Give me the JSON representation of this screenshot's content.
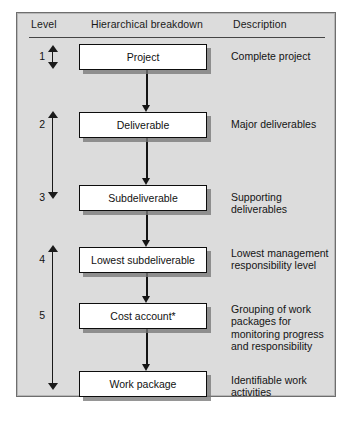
{
  "figure": {
    "background_color": "#ffffff",
    "panel_color": "#dcdcdc",
    "line_color": "#141414"
  },
  "columns": {
    "level_header": "Level",
    "breakdown_header": "Hierarchical breakdown",
    "description_header": "Description"
  },
  "rows": [
    {
      "level": "1",
      "box_label": "Project",
      "description": "Complete project"
    },
    {
      "level": "2",
      "box_label": "Deliverable",
      "description": "Major deliverables"
    },
    {
      "level": "3",
      "box_label": "Subdeliverable",
      "description": "Supporting deliverables"
    },
    {
      "level": "4",
      "box_label": "Lowest subdeliverable",
      "description": "Lowest management responsibility level"
    },
    {
      "level": "5",
      "box_label": "Cost account*",
      "description": "Grouping of work packages for monitoring progress and responsibility"
    },
    {
      "level": "",
      "box_label": "Work package",
      "description": "Identifiable work activities"
    }
  ],
  "level_arrows": [
    {
      "name": "arrow-level-1",
      "span": "level 1"
    },
    {
      "name": "arrow-level-2-to-3",
      "span": "levels 2 to 3"
    },
    {
      "name": "arrow-level-4-to-6",
      "span": "levels 4 to work package"
    }
  ]
}
